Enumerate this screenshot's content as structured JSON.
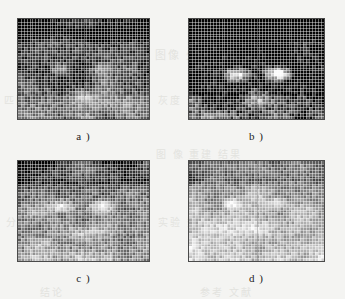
{
  "figure": {
    "background_color": "#f4f4f2",
    "panel_border_color": "#4a4a4a",
    "label_color": "#1c1c1c",
    "panels": [
      {
        "id": "a",
        "label": "a )",
        "kind": "mosaic-face",
        "cols": 46,
        "rows": 35,
        "width": 133,
        "height": 102,
        "description": "blocky grayscale face mosaic, dark upper band, bright cheek clusters",
        "mean_level": 72,
        "contrast": 0.62,
        "seed": 1101,
        "features": {
          "brow_band_y": 0.14,
          "eye_left": [
            0.33,
            0.5
          ],
          "eye_right": [
            0.63,
            0.5
          ],
          "eye_radius": 0.11,
          "eye_brightness": 0.55,
          "mouth": [
            0.5,
            0.78
          ],
          "background_level": 0.22
        }
      },
      {
        "id": "b",
        "label": "b )",
        "kind": "mosaic-face",
        "cols": 46,
        "rows": 35,
        "width": 137,
        "height": 102,
        "description": "high contrast mosaic, very dark top band, two bright round eye blobs",
        "mean_level": 66,
        "contrast": 0.86,
        "seed": 2202,
        "features": {
          "brow_band_y": 0.12,
          "eye_left": [
            0.35,
            0.55
          ],
          "eye_right": [
            0.66,
            0.55
          ],
          "eye_radius": 0.13,
          "eye_brightness": 0.95,
          "mouth": [
            0.5,
            0.8
          ],
          "background_level": 0.12
        }
      },
      {
        "id": "c",
        "label": "c )",
        "kind": "mosaic-face",
        "cols": 46,
        "rows": 35,
        "width": 133,
        "height": 102,
        "description": "mid grey mosaic, dark horizontal brow streak, bright mid face and lower band",
        "mean_level": 96,
        "contrast": 0.6,
        "seed": 3303,
        "features": {
          "brow_band_y": 0.2,
          "eye_left": [
            0.33,
            0.45
          ],
          "eye_right": [
            0.64,
            0.45
          ],
          "eye_radius": 0.12,
          "eye_brightness": 0.72,
          "mouth": [
            0.5,
            0.72
          ],
          "background_level": 0.38
        }
      },
      {
        "id": "d",
        "label": "d )",
        "kind": "mosaic-face",
        "cols": 46,
        "rows": 35,
        "width": 137,
        "height": 102,
        "description": "lightest mosaic, speckled dark patches near top, uniform bright lower half",
        "mean_level": 118,
        "contrast": 0.5,
        "seed": 4404,
        "features": {
          "brow_band_y": 0.18,
          "eye_left": [
            0.32,
            0.42
          ],
          "eye_right": [
            0.66,
            0.42
          ],
          "eye_radius": 0.1,
          "eye_brightness": 0.6,
          "mouth": [
            0.5,
            0.68
          ],
          "background_level": 0.52
        }
      }
    ]
  },
  "ghost_text": [
    {
      "text": "图像 处理",
      "x": 155,
      "y": 46,
      "size": 11
    },
    {
      "text": "特征 提取",
      "x": 243,
      "y": 46,
      "size": 11
    },
    {
      "text": "灰度 分布 直方图",
      "x": 158,
      "y": 92,
      "size": 10
    },
    {
      "text": "匹配",
      "x": 4,
      "y": 92,
      "size": 10
    },
    {
      "text": "图 像 重建 结果",
      "x": 156,
      "y": 146,
      "size": 10
    },
    {
      "text": "分析",
      "x": 6,
      "y": 214,
      "size": 10
    },
    {
      "text": "实验 数据 对比",
      "x": 158,
      "y": 214,
      "size": 10
    },
    {
      "text": "结论",
      "x": 40,
      "y": 284,
      "size": 10
    },
    {
      "text": "参考 文献",
      "x": 200,
      "y": 284,
      "size": 10
    }
  ]
}
